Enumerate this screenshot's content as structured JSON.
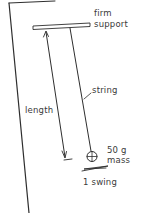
{
  "diagram": {
    "ink_color": "#2e2e2e",
    "labels": {
      "support_line1": "firm",
      "support_line2": "support",
      "string": "string",
      "length": "length",
      "mass_line1": "50 g",
      "mass_line2": "mass",
      "swing": "1 swing"
    },
    "components": [
      {
        "name": "firm support",
        "type": "horizontal bar"
      },
      {
        "name": "string",
        "type": "line"
      },
      {
        "name": "length",
        "type": "double-headed arrow"
      },
      {
        "name": "50 g mass",
        "type": "circle with cross"
      },
      {
        "name": "1 swing",
        "type": "motion squiggle"
      }
    ]
  }
}
